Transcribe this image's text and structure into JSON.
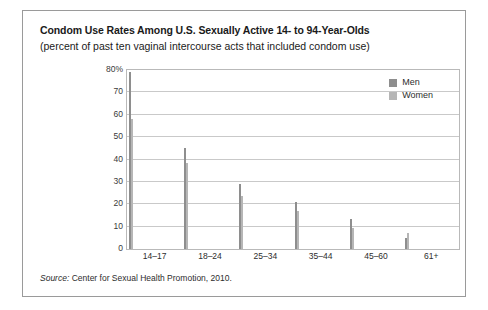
{
  "chart_data": {
    "type": "bar",
    "title": "Condom Use Rates Among U.S. Sexually Active 14- to 94-Year-Olds",
    "subtitle": "(percent of past ten vaginal intercourse acts that included condom use)",
    "xlabel": "",
    "ylabel": "",
    "ylim": [
      0,
      80
    ],
    "ytick_values": [
      0,
      10,
      20,
      30,
      40,
      50,
      60,
      70,
      80
    ],
    "ytick_labels": [
      "0",
      "10",
      "20",
      "30",
      "40",
      "50",
      "60",
      "70",
      "80%"
    ],
    "grid": true,
    "legend_position": "top-right-inside",
    "categories": [
      "14–17",
      "18–24",
      "25–34",
      "35–44",
      "45–60",
      "61+"
    ],
    "series": [
      {
        "name": "Men",
        "color": "#8e8e8e",
        "values": [
          79,
          45,
          29,
          21,
          13.5,
          5
        ]
      },
      {
        "name": "Women",
        "color": "#b6b6b6",
        "values": [
          58,
          38.5,
          23.5,
          17,
          9.5,
          7
        ]
      }
    ],
    "source_label": "Source:",
    "source_text": "Center for Sexual Health Promotion, 2010."
  }
}
